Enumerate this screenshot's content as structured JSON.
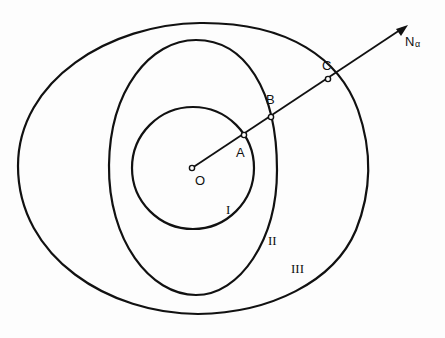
{
  "figure": {
    "points": {
      "O": {
        "label": "O",
        "x": 192,
        "y": 168
      },
      "A": {
        "label": "A",
        "x": 244,
        "y": 135
      },
      "B": {
        "label": "B",
        "x": 271,
        "y": 117
      },
      "C": {
        "label": "C",
        "x": 328,
        "y": 79
      }
    },
    "ray": {
      "label": "N",
      "subscript": "α",
      "tip_x": 406,
      "tip_y": 26
    },
    "regions": [
      {
        "id": "I",
        "label": "I"
      },
      {
        "id": "II",
        "label": "II"
      },
      {
        "id": "III",
        "label": "III"
      }
    ],
    "colors": {
      "stroke": "#111111",
      "background": "#fdfdfd"
    }
  }
}
